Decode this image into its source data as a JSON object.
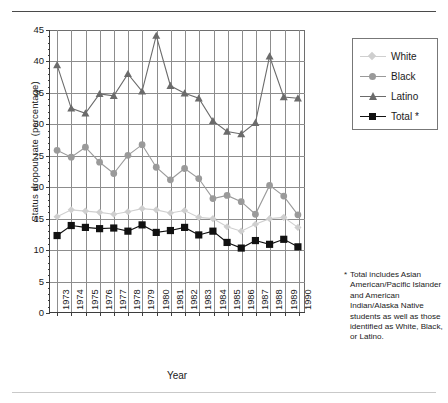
{
  "chart_data": {
    "type": "line",
    "title": "",
    "xlabel": "Year",
    "ylabel": "Status dropout rate (percentage)",
    "ylim": [
      0,
      45
    ],
    "ytick_step": 5,
    "yticks": [
      0,
      5,
      10,
      15,
      20,
      25,
      30,
      35,
      40,
      45
    ],
    "grid": true,
    "legend_position": "top-right",
    "categories": [
      "1973",
      "1974",
      "1975",
      "1976",
      "1977",
      "1978",
      "1979",
      "1980",
      "1981",
      "1982",
      "1983",
      "1984",
      "1985",
      "1986",
      "1987",
      "1988",
      "1989",
      "1990"
    ],
    "series": [
      {
        "name": "White",
        "color": "#cfcfcf",
        "marker": "diamond",
        "values": [
          15.2,
          16.3,
          16.1,
          15.9,
          15.6,
          16.0,
          16.5,
          16.3,
          15.8,
          16.2,
          15.1,
          14.9,
          13.6,
          12.9,
          14.0,
          14.9,
          15.1,
          13.5
        ]
      },
      {
        "name": "Black",
        "color": "#9a9a9a",
        "marker": "circle",
        "values": [
          25.8,
          24.7,
          26.3,
          23.9,
          22.1,
          25.0,
          26.7,
          23.1,
          21.1,
          22.9,
          21.3,
          18.1,
          18.6,
          17.6,
          15.6,
          20.2,
          18.5,
          15.5
        ]
      },
      {
        "name": "Latino",
        "color": "#6b6b6b",
        "marker": "triangle",
        "values": [
          39.4,
          32.5,
          31.7,
          34.8,
          34.5,
          38.0,
          35.2,
          44.1,
          36.1,
          34.9,
          34.1,
          30.5,
          28.8,
          28.4,
          30.2,
          40.8,
          34.3,
          34.1
        ]
      },
      {
        "name": "Total *",
        "color": "#111111",
        "marker": "square",
        "values": [
          12.2,
          13.8,
          13.5,
          13.3,
          13.4,
          12.9,
          13.9,
          12.7,
          13.0,
          13.5,
          12.3,
          12.9,
          11.1,
          10.2,
          11.4,
          10.8,
          11.6,
          10.4
        ]
      }
    ]
  },
  "legend": {
    "items": [
      {
        "label": "White"
      },
      {
        "label": "Black"
      },
      {
        "label": "Latino"
      },
      {
        "label": "Total *"
      }
    ]
  },
  "footnote": {
    "marker": "*",
    "text": "Total includes Asian American/Pacific Islander and American Indian/Alaska Native students as well as those identified as White, Black, or Latino."
  }
}
